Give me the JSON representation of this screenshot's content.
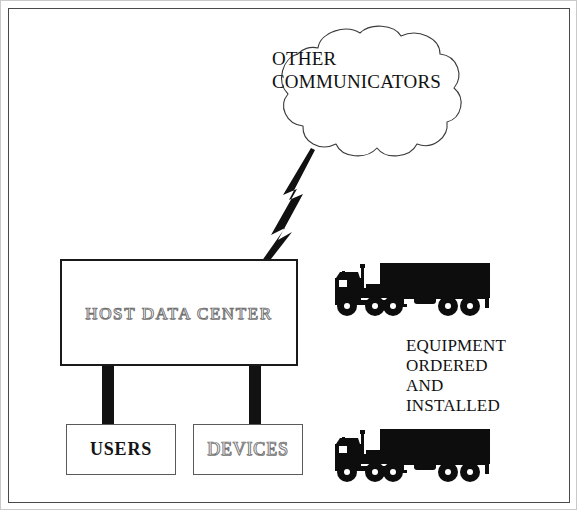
{
  "diagram": {
    "background_color": "#ffffff",
    "frame_color": "#4a4a4a",
    "cloud": {
      "label": "OTHER\nCOMMUNICATORS",
      "outline_color": "#3a3a3a",
      "fill_color": "#ffffff"
    },
    "connector": {
      "name": "lightning-bolt",
      "color": "#111111"
    },
    "host": {
      "label": "HOST DATA CENTER",
      "text_style": "outlined",
      "border_color": "#1a1a1a"
    },
    "legs": {
      "color": "#121212",
      "count": 2
    },
    "sub_boxes": [
      {
        "label": "USERS",
        "text_style": "solid",
        "border_color": "#5a5a5a"
      },
      {
        "label": "DEVICES",
        "text_style": "outlined",
        "border_color": "#5a5a5a"
      }
    ],
    "equipment": {
      "caption": "EQUIPMENT\nORDERED\nAND\nINSTALLED",
      "truck_color": "#0d0d0d",
      "truck_count": 2
    }
  }
}
